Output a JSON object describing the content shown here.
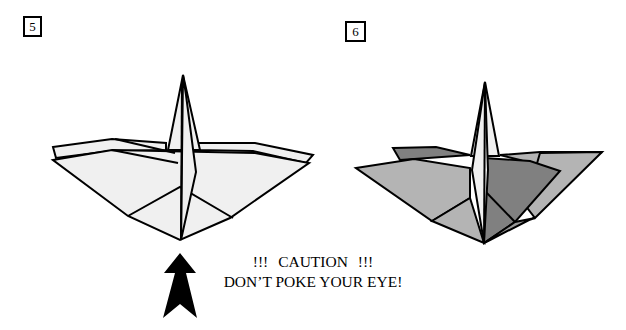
{
  "steps": [
    {
      "number": "5",
      "description": "Crane base with lightly shaded flaps; arrow points up at the bottom point"
    },
    {
      "number": "6",
      "description": "Crane base shaded in grey tones showing result of fold"
    }
  ],
  "caution": {
    "line1": "!!!   CAUTION   !!!",
    "line2": "DON’T POKE YOUR EYE!"
  },
  "colors": {
    "stroke": "#000000",
    "paper_light": "#f0f0f0",
    "paper_mid": "#b4b4b4",
    "paper_dark": "#808080",
    "paper_medium_dark": "#999999",
    "arrow": "#000000"
  }
}
